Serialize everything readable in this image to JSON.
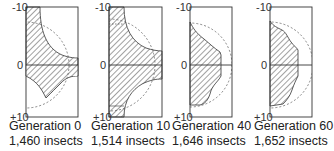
{
  "figure": {
    "axis_ticks": {
      "top": "-10",
      "middle": "0",
      "bottom": "+10"
    },
    "colors": {
      "frame": "#333333",
      "hatch": "#444444",
      "dashed_circle": "#555555",
      "background": "#ffffff"
    },
    "panels": [
      {
        "generation_label": "Generation 0",
        "count_label": "1,460 insects"
      },
      {
        "generation_label": "Generation 10",
        "count_label": "1,514 insects"
      },
      {
        "generation_label": "Generation 40",
        "count_label": "1,646 insects"
      },
      {
        "generation_label": "Generation 60",
        "count_label": "1,652 insects"
      }
    ]
  }
}
